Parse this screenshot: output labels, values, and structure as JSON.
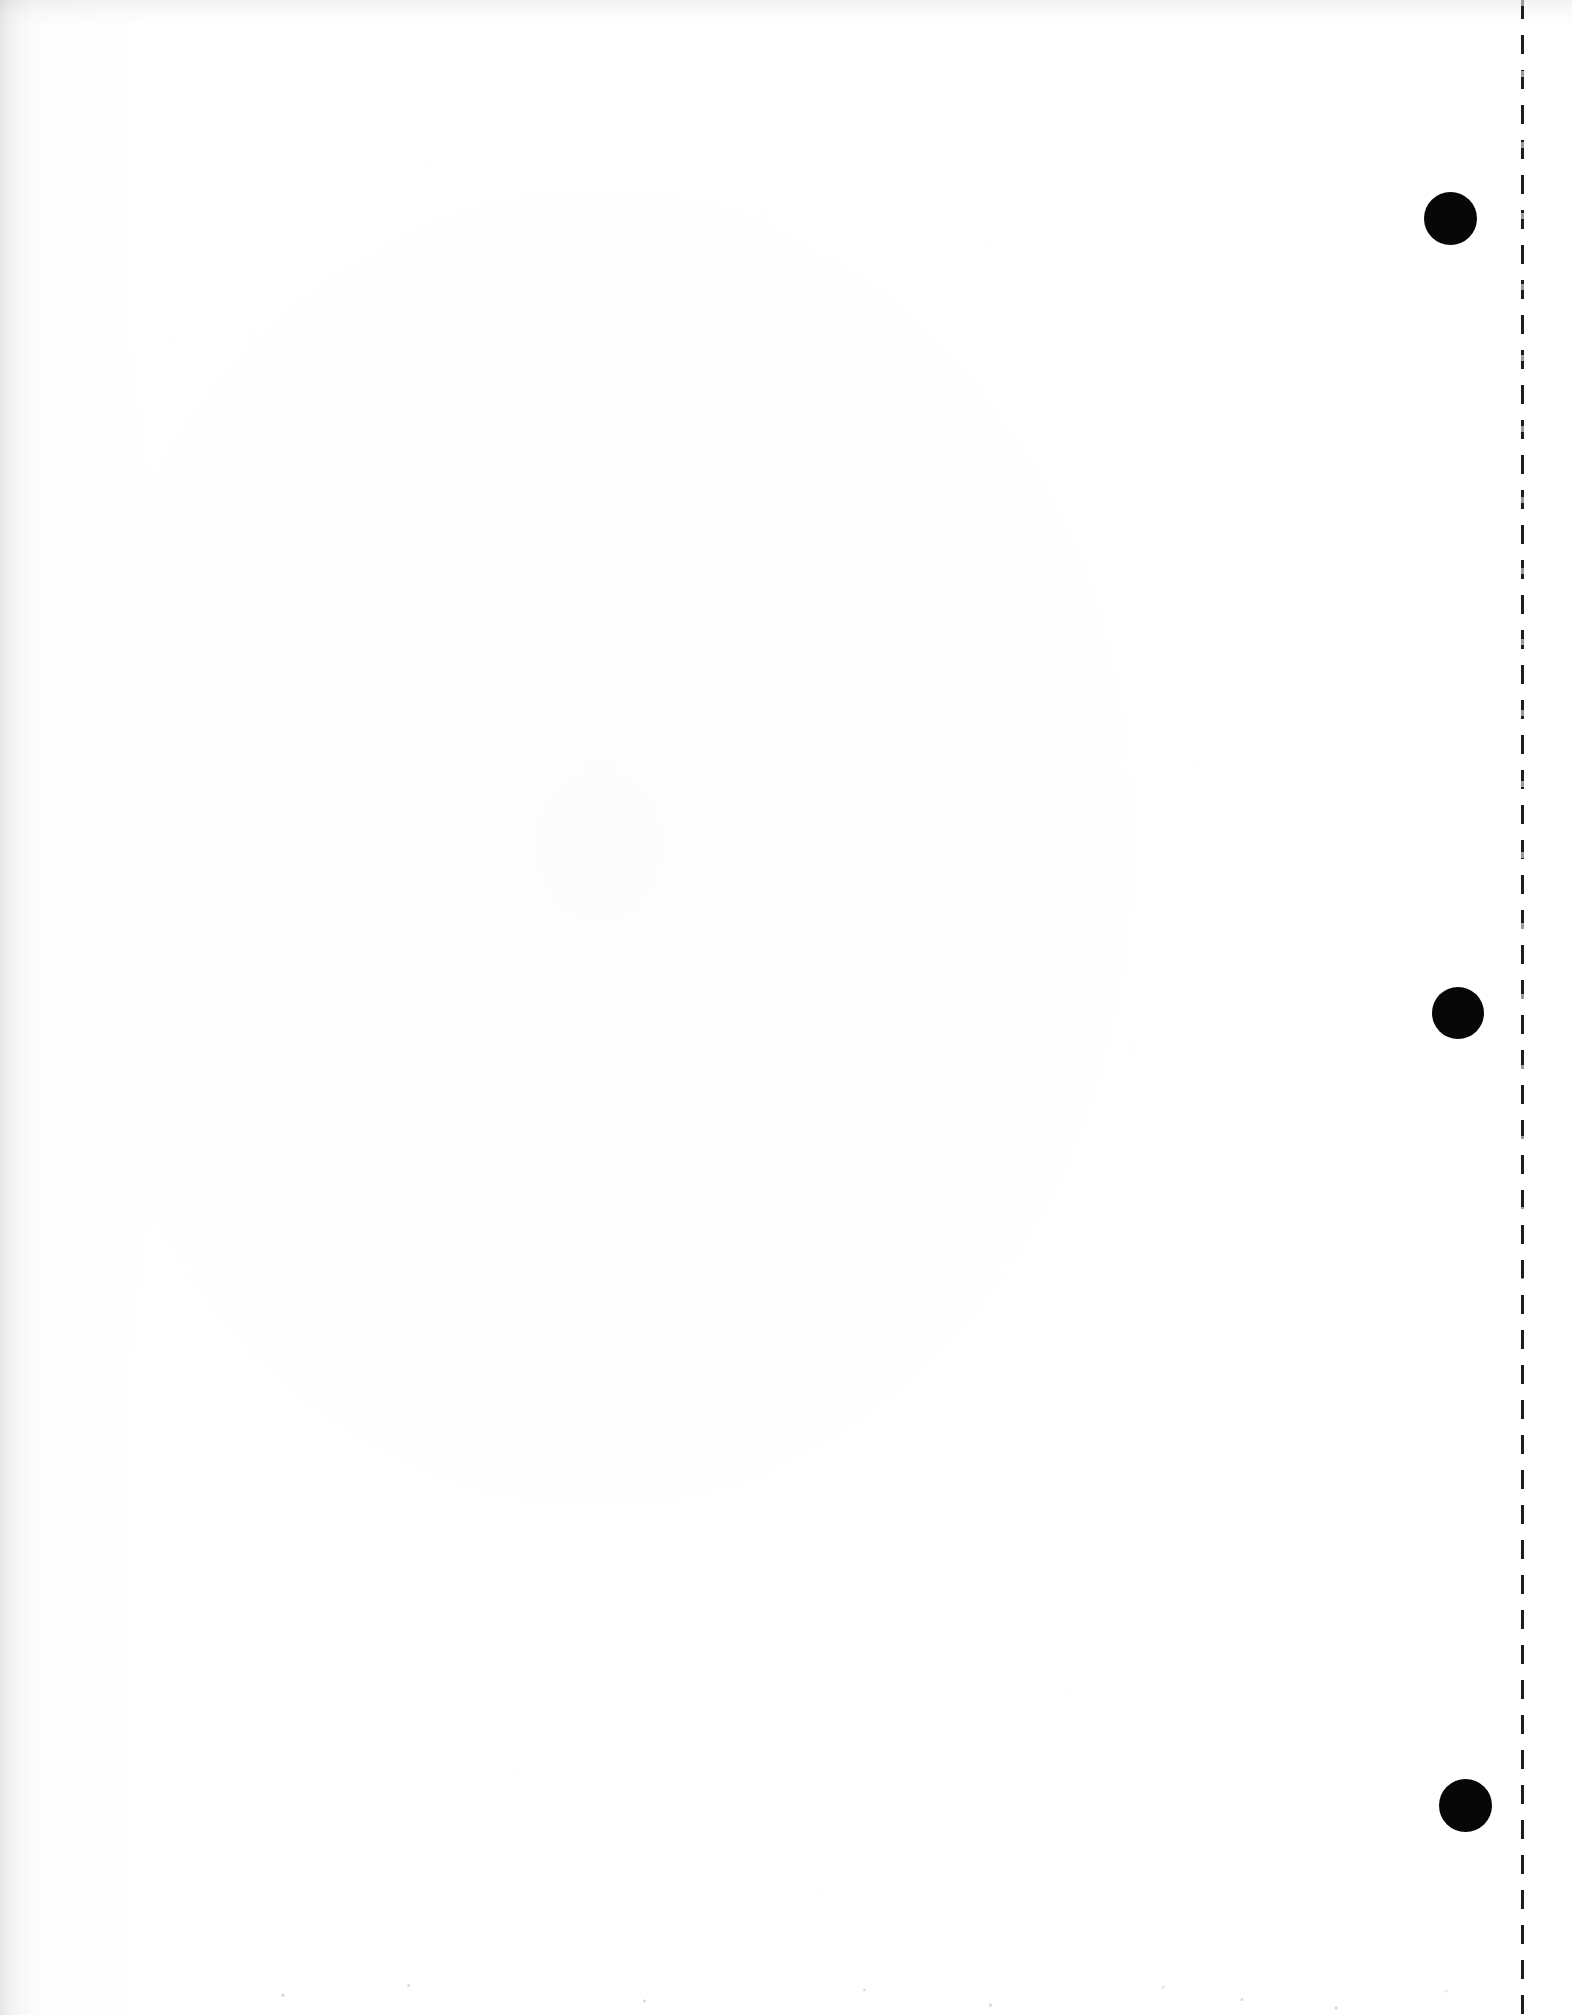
{
  "page": {
    "label": "Scanned page",
    "content_text": "",
    "width": 1572,
    "height": 2015,
    "background_color": "#ffffff",
    "ink_color": "#070707"
  },
  "punch_holes": {
    "label": "Binder punch holes",
    "count": 3,
    "diameter": 52,
    "color": "#070707",
    "items": [
      {
        "name": "punch-hole-top",
        "cx": 1450,
        "cy": 218,
        "d": 53
      },
      {
        "name": "punch-hole-middle",
        "cx": 1458,
        "cy": 1013,
        "d": 52
      },
      {
        "name": "punch-hole-bottom",
        "cx": 1465,
        "cy": 1805,
        "d": 53
      }
    ]
  },
  "perforation": {
    "label": "Perforation tear line",
    "x": 1521,
    "width": 3,
    "color": "#0a0a0a",
    "dash_length": 19,
    "gap_length": 16
  },
  "margins": {
    "left_edge_shadow": true,
    "top_edge_shadow": true,
    "bottom_edge_speckle": true
  }
}
